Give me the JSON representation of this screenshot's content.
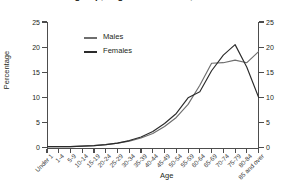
{
  "chart_data": {
    "type": "line",
    "title": "group, England and Wales, 1997",
    "xlabel": "Age",
    "ylabel": "Percentage",
    "ylim": [
      0,
      25
    ],
    "yticks": [
      0,
      5,
      10,
      15,
      20,
      25
    ],
    "ytick_labels": [
      "0",
      "5",
      "10",
      "15",
      "20",
      "25"
    ],
    "right_axis": {
      "label": "Percentage",
      "ylim": [
        0,
        25
      ],
      "yticks": [
        0,
        5,
        10,
        15,
        20,
        25
      ],
      "ytick_labels": [
        "0",
        "5",
        "10",
        "15",
        "20",
        "25"
      ]
    },
    "grid": false,
    "legend_position": "upper-left-inside",
    "categories": [
      "Under 1",
      "1-4",
      "5-9",
      "10-14",
      "15-19",
      "20-24",
      "25-29",
      "30-34",
      "35-39",
      "40-44",
      "45-49",
      "50-54",
      "55-59",
      "60-64",
      "65-69",
      "70-74",
      "75-79",
      "80-84",
      "85 and over"
    ],
    "series": [
      {
        "name": "Males",
        "color": "#6e6e6e",
        "values": [
          0.2,
          0.2,
          0.2,
          0.3,
          0.4,
          0.6,
          0.9,
          1.3,
          1.9,
          2.8,
          4.2,
          6.0,
          8.6,
          12.4,
          16.8,
          16.9,
          17.4,
          16.9,
          19.1
        ]
      },
      {
        "name": "Females",
        "color": "#2b2b2b",
        "values": [
          0.2,
          0.2,
          0.2,
          0.3,
          0.4,
          0.6,
          0.9,
          1.4,
          2.1,
          3.2,
          4.8,
          6.8,
          9.9,
          11.1,
          15.3,
          18.4,
          20.5,
          16.0,
          10.0
        ]
      }
    ]
  },
  "legend": {
    "items": [
      {
        "label": "Males",
        "color": "#6e6e6e"
      },
      {
        "label": "Females",
        "color": "#2b2b2b"
      }
    ]
  }
}
